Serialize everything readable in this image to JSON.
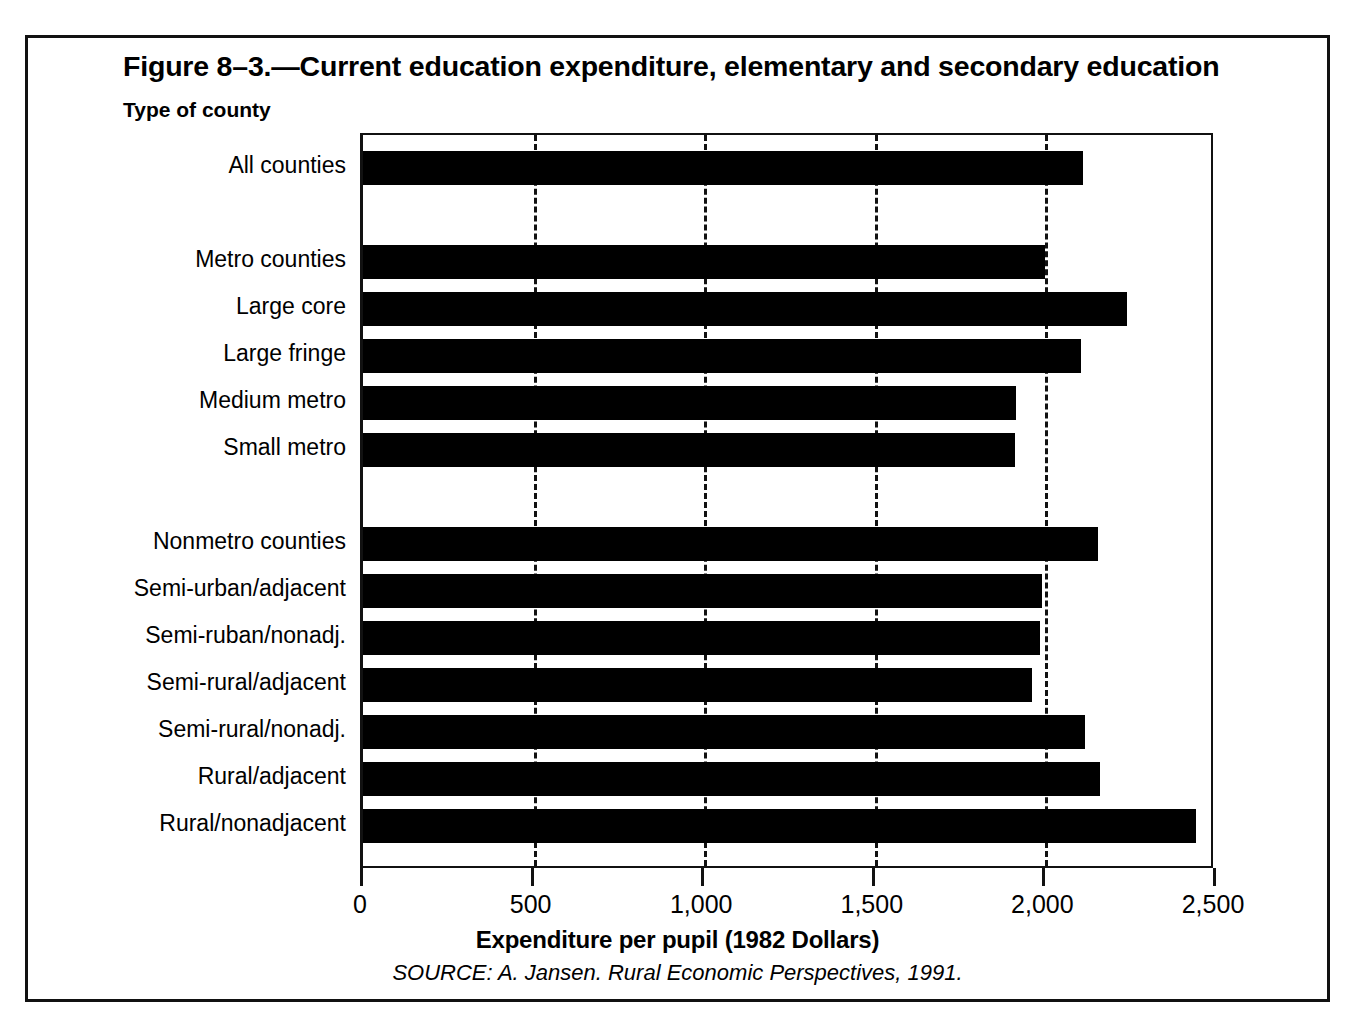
{
  "figure": {
    "title": "Figure 8–3.—Current education expenditure, elementary and secondary education",
    "group_axis_title": "Type of county",
    "x_axis_title": "Expenditure per pupil (1982 Dollars)",
    "source": "SOURCE: A. Jansen. Rural Economic Perspectives, 1991.",
    "bar_color": "#000000",
    "frame_color": "#111111",
    "background": "#ffffff"
  },
  "chart_data": {
    "type": "bar",
    "orientation": "horizontal",
    "title": "Figure 8–3.—Current education expenditure, elementary and secondary education",
    "subtitle": "Type of county",
    "xlabel": "Expenditure per pupil (1982 Dollars)",
    "ylabel": "Type of county",
    "xlim": [
      0,
      2500
    ],
    "xticks": [
      0,
      500,
      1000,
      1500,
      2000,
      2500
    ],
    "xtick_labels": [
      "0",
      "500",
      "1,000",
      "1,500",
      "2,000",
      "2,500"
    ],
    "gridlines": [
      500,
      1000,
      1500,
      2000
    ],
    "grid": "vertical-dashed",
    "legend": "none",
    "source": "SOURCE: A. Jansen. Rural Economic Perspectives, 1991.",
    "categories": [
      "All counties",
      "Metro counties",
      "Large core",
      "Large fringe",
      "Medium metro",
      "Small metro",
      "Nonmetro counties",
      "Semi-urban/adjacent",
      "Semi-ruban/nonadj.",
      "Semi-rural/adjacent",
      "Semi-rural/nonadj.",
      "Rural/adjacent",
      "Rural/nonadjacent"
    ],
    "values": [
      2110,
      2000,
      2240,
      2105,
      1915,
      1910,
      2155,
      1990,
      1985,
      1960,
      2115,
      2160,
      2440
    ],
    "bars": [
      {
        "label": "All counties",
        "value": 2110,
        "row": 0,
        "group": "total"
      },
      {
        "label": "Metro counties",
        "value": 2000,
        "row": 2,
        "group": "metro"
      },
      {
        "label": "Large core",
        "value": 2240,
        "row": 3,
        "group": "metro"
      },
      {
        "label": "Large fringe",
        "value": 2105,
        "row": 4,
        "group": "metro"
      },
      {
        "label": "Medium metro",
        "value": 1915,
        "row": 5,
        "group": "metro"
      },
      {
        "label": "Small metro",
        "value": 1910,
        "row": 6,
        "group": "metro"
      },
      {
        "label": "Nonmetro counties",
        "value": 2155,
        "row": 8,
        "group": "nonmetro"
      },
      {
        "label": "Semi-urban/adjacent",
        "value": 1990,
        "row": 9,
        "group": "nonmetro"
      },
      {
        "label": "Semi-ruban/nonadj.",
        "value": 1985,
        "row": 10,
        "group": "nonmetro"
      },
      {
        "label": "Semi-rural/adjacent",
        "value": 1960,
        "row": 11,
        "group": "nonmetro"
      },
      {
        "label": "Semi-rural/nonadj.",
        "value": 2115,
        "row": 12,
        "group": "nonmetro"
      },
      {
        "label": "Rural/adjacent",
        "value": 2160,
        "row": 13,
        "group": "nonmetro"
      },
      {
        "label": "Rural/nonadjacent",
        "value": 2440,
        "row": 14,
        "group": "nonmetro"
      }
    ]
  }
}
